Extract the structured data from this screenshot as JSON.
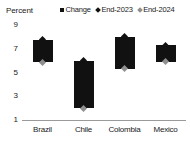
{
  "chart_data": {
    "type": "bar",
    "title": "",
    "subtitle": "",
    "unit_label": "Percent",
    "xlabel": "",
    "ylabel": "",
    "categories": [
      "Brazil",
      "Chile",
      "Colombia",
      "Mexico"
    ],
    "ylim": [
      1,
      9
    ],
    "yticks": [
      9,
      7,
      5,
      3,
      1
    ],
    "grid": false,
    "legend_position": "top-right",
    "legend": [
      {
        "label": "Change",
        "marker": "square",
        "color": "#111111"
      },
      {
        "label": "End-2023",
        "marker": "diamond",
        "color": "#111111"
      },
      {
        "label": "End-2024",
        "marker": "diamond",
        "color": "#8f8f8f"
      }
    ],
    "series": [
      {
        "name": "End-2023",
        "values": [
          7.75,
          6.0,
          8.0,
          7.3
        ]
      },
      {
        "name": "End-2024",
        "values": [
          5.85,
          2.0,
          5.3,
          5.9
        ]
      },
      {
        "name": "Change",
        "values": [
          -1.9,
          -4.0,
          -2.7,
          -1.4
        ]
      }
    ]
  },
  "colors": {
    "bar": "#111111",
    "end_2023": "#111111",
    "end_2024": "#8f8f8f",
    "axis": "#9a9a9a",
    "text": "#1a1a1a",
    "background": "#ffffff"
  }
}
